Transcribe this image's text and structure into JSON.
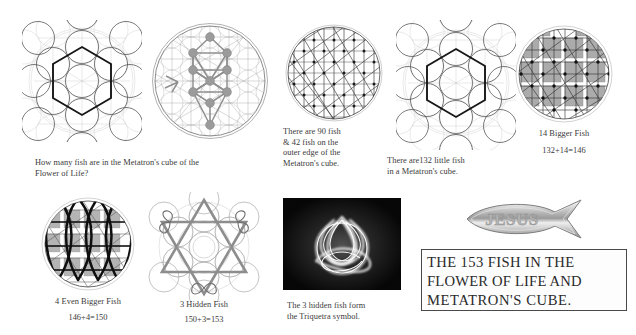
{
  "document": {
    "title": "The 153 Fish in the Flower of Life and Metatron's Cube",
    "background_color": "#ffffff",
    "ink_color": "#2b2b2b"
  },
  "figures": {
    "metatron_question": {
      "name": "Metatron's Cube over Flower of Life",
      "icon": "metatron-cube-diagram"
    },
    "flower_tree": {
      "name": "Flower of Life with Tree of Life",
      "icon": "flower-of-life-tree-diagram"
    },
    "fish_lattice": {
      "name": "Vesica fish lattice in circle",
      "icon": "fish-lattice-diagram"
    },
    "metatron_132": {
      "name": "Metatron's Cube with 132 little fish",
      "icon": "metatron-cube-diagram"
    },
    "bigger_fish": {
      "name": "Lattice with 14 bigger fish shaded",
      "icon": "bigger-fish-diagram"
    },
    "even_bigger_fish": {
      "name": "Circle with 4 even bigger fish",
      "icon": "even-bigger-fish-diagram"
    },
    "hidden_fish": {
      "name": "Hexagram with 3 hidden fish",
      "icon": "hexagram-hidden-fish-diagram"
    },
    "triquetra_photo": {
      "name": "Photograph of glowing Triquetra",
      "icon": "triquetra-photo"
    },
    "jesus_emblem": {
      "name": "Chrome JESUS ichthys fish emblem",
      "icon": "jesus-fish-icon",
      "label": "JESUS"
    }
  },
  "captions": {
    "question": "How many fish are in the Metatron's cube of the\nFlower of Life?",
    "outer_edge": "There are 90 fish\n& 42 fish on the\nouter edge of the\nMetatron's cube.",
    "little_fish": "There are132 little fish\nin a Metatron's cube.",
    "bigger_fish_label": "14 Bigger Fish",
    "bigger_fish_sum": "132+14=146",
    "even_bigger_fish_label": "4 Even Bigger Fish",
    "even_bigger_fish_sum": "146+4=150",
    "hidden_fish_label": "3 Hidden Fish",
    "hidden_fish_sum": "150+3=153",
    "triquetra": "The 3 hidden fish form\nthe Triquetra symbol."
  },
  "headline": {
    "line1": "THE 153 FISH IN THE",
    "line2": "FLOWER OF LIFE AND",
    "line3": "METATRON'S CUBE."
  },
  "colors": {
    "ink": "#2b2b2b",
    "faint_circle": "#c9c9c9",
    "bold_line": "#1a1a1a",
    "shade_gray": "#9a9a9a",
    "box_border": "#4a4a4a",
    "photo_background": "#0a0a0a",
    "photo_glow": "#ffffff",
    "chrome_light": "#f2f2f2",
    "chrome_dark": "#8d8d8d"
  }
}
